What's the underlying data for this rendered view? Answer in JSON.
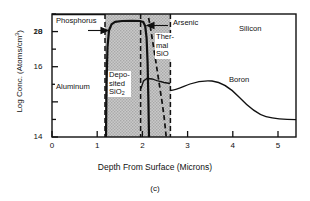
{
  "figure": {
    "caption": "(c)",
    "xlabel": "Depth From Surface (Microns)",
    "ylabel_text": "Log Conc. (Atoms/cm",
    "ylabel_sup": "3",
    "ylabel_tail": ")"
  },
  "annotations": {
    "phosphorus": "Phosphorus",
    "arsenic": "Arsenic",
    "aluminum": "Aluminum",
    "silicon": "Silicon",
    "boron": "Boron",
    "deposited_line1": "Depo-",
    "deposited_line2": "sited",
    "deposited_line3a": "SiO",
    "deposited_line3b": "2",
    "thermal_line1": "Ther-",
    "thermal_line2": "mal",
    "thermal_line3": "SiO"
  },
  "chart_data": {
    "type": "line",
    "title": "",
    "xlabel": "Depth From Surface (Microns)",
    "ylabel": "Log Conc. (Atoms/cm^3)",
    "xlim": [
      0,
      5.4
    ],
    "ylim": [
      14,
      21
    ],
    "xticks": [
      0,
      1,
      2,
      3,
      4,
      5
    ],
    "xtick_labels": [
      "0",
      "1",
      "2",
      "3",
      "4",
      "5"
    ],
    "yticks": [
      14,
      16,
      18,
      20
    ],
    "ytick_labels": [
      "14",
      "16",
      "18",
      "20"
    ],
    "yminor_ticks": [
      15,
      17,
      19,
      21
    ],
    "grid": false,
    "legend": "inline-annotations",
    "regions": [
      {
        "name": "Aluminum",
        "x_start": 0.0,
        "x_end": 1.18,
        "shading": "none"
      },
      {
        "name": "Deposited SiO2",
        "x_start": 1.18,
        "x_end": 1.97,
        "shading": "hatched-gray"
      },
      {
        "name": "Thermal SiO",
        "x_start": 1.97,
        "x_end": 2.63,
        "shading": "hatched-gray"
      },
      {
        "name": "Silicon",
        "x_start": 2.63,
        "x_end": 5.4,
        "shading": "none"
      }
    ],
    "series": [
      {
        "name": "Phosphorus",
        "style": "solid",
        "points": [
          [
            1.2,
            14.0
          ],
          [
            1.22,
            17.0
          ],
          [
            1.24,
            19.4
          ],
          [
            1.27,
            20.4
          ],
          [
            1.32,
            20.75
          ],
          [
            1.4,
            20.85
          ],
          [
            1.6,
            20.88
          ],
          [
            1.8,
            20.88
          ],
          [
            1.9,
            20.82
          ],
          [
            1.94,
            20.5
          ],
          [
            1.96,
            19.6
          ],
          [
            1.98,
            17.6
          ],
          [
            1.99,
            15.4
          ],
          [
            2.0,
            14.0
          ]
        ]
      },
      {
        "name": "Arsenic",
        "style": "dashed",
        "points": [
          [
            1.99,
            20.9
          ],
          [
            2.02,
            20.4
          ],
          [
            2.06,
            19.4
          ],
          [
            2.1,
            18.4
          ],
          [
            2.14,
            17.4
          ],
          [
            2.18,
            16.4
          ],
          [
            2.22,
            15.4
          ],
          [
            2.26,
            14.4
          ],
          [
            2.28,
            14.0
          ]
        ]
      },
      {
        "name": "Aluminum",
        "style": "solid-flat",
        "points": [
          [
            0.0,
            21.0
          ],
          [
            1.18,
            21.0
          ]
        ]
      },
      {
        "name": "Boron",
        "style": "solid",
        "points": [
          [
            1.97,
            16.6
          ],
          [
            2.03,
            17.05
          ],
          [
            2.1,
            17.15
          ],
          [
            2.2,
            17.1
          ],
          [
            2.35,
            16.95
          ],
          [
            2.5,
            16.85
          ],
          [
            2.62,
            16.8
          ],
          [
            2.63,
            16.4
          ],
          [
            2.72,
            16.42
          ],
          [
            2.85,
            16.55
          ],
          [
            3.0,
            16.68
          ],
          [
            3.15,
            16.72
          ],
          [
            3.3,
            16.68
          ],
          [
            3.5,
            16.5
          ],
          [
            3.75,
            16.1
          ],
          [
            4.0,
            15.65
          ],
          [
            4.3,
            15.32
          ],
          [
            4.6,
            15.16
          ],
          [
            5.0,
            15.1
          ],
          [
            5.35,
            15.1
          ]
        ]
      }
    ]
  }
}
